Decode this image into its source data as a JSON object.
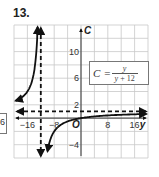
{
  "problem": {
    "number_label": "13."
  },
  "left_fragment": {
    "text": "6"
  },
  "equation": {
    "lhs": "C",
    "equals": "=",
    "numerator": "y",
    "denominator_var": "y",
    "denominator_rest": " + 12"
  },
  "chart_data": {
    "type": "line",
    "title": "",
    "function": "C = y / (y + 12)",
    "xlabel": "y",
    "ylabel": "C",
    "origin_label": "O",
    "xlim": [
      -20,
      20
    ],
    "ylim": [
      -6,
      14
    ],
    "x_ticks": [
      -16,
      -8,
      8,
      16
    ],
    "x_tick_labels": [
      "−16",
      "−8",
      "8",
      "16"
    ],
    "y_ticks": [
      10,
      6,
      2,
      -4
    ],
    "y_tick_labels": [
      "10",
      "6",
      "2",
      "−4"
    ],
    "grid": true,
    "grid_spacing": {
      "x": 4,
      "y": 2
    },
    "asymptotes": {
      "vertical": {
        "y": -12,
        "style": "dashed"
      },
      "horizontal": {
        "C": 1,
        "style": "dashed"
      }
    },
    "series": [
      {
        "name": "left branch (y < -12)",
        "points": [
          [
            -20,
            2.5
          ],
          [
            -18,
            3
          ],
          [
            -16,
            4
          ],
          [
            -14,
            7
          ],
          [
            -13,
            13
          ]
        ]
      },
      {
        "name": "right branch (y > -12)",
        "points": [
          [
            -11,
            -11
          ],
          [
            -10,
            -5
          ],
          [
            -8,
            -2
          ],
          [
            -4,
            -0.5
          ],
          [
            0,
            0
          ],
          [
            4,
            0.25
          ],
          [
            8,
            0.4
          ],
          [
            12,
            0.5
          ],
          [
            16,
            0.57
          ],
          [
            20,
            0.625
          ]
        ]
      }
    ],
    "legend": []
  }
}
